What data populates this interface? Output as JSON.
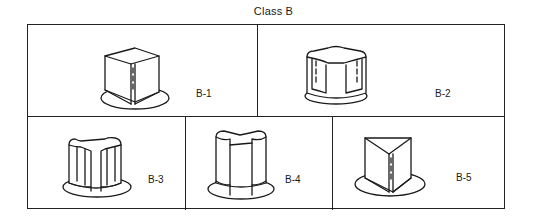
{
  "figure": {
    "title": "Class B",
    "panels": [
      {
        "id": "B-1",
        "label": "B-1",
        "shape": "cube-split-skirted-knob"
      },
      {
        "id": "B-2",
        "label": "B-2",
        "shape": "quad-fluted-skirted-knob"
      },
      {
        "id": "B-3",
        "label": "B-3",
        "shape": "three-notch-fluted-skirted-knob"
      },
      {
        "id": "B-4",
        "label": "B-4",
        "shape": "split-cylinder-skirted-knob"
      },
      {
        "id": "B-5",
        "label": "B-5",
        "shape": "triangular-pointer-skirted-knob"
      }
    ]
  }
}
